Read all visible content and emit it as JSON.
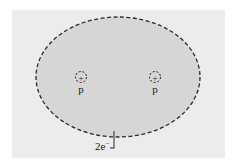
{
  "diagram": {
    "title": "",
    "colors": {
      "page_background": "#ffffff",
      "panel_background": "#ececec",
      "electron_cloud_fill": "#d6d6d6",
      "stroke": "#2a2a2a"
    },
    "electron_cloud": {
      "shape": "ellipse",
      "outline": "dashed",
      "label": "2e",
      "label_superscript": "−"
    },
    "nuclei": [
      {
        "symbol": "+",
        "label": "p"
      },
      {
        "symbol": "+",
        "label": "p"
      }
    ]
  }
}
